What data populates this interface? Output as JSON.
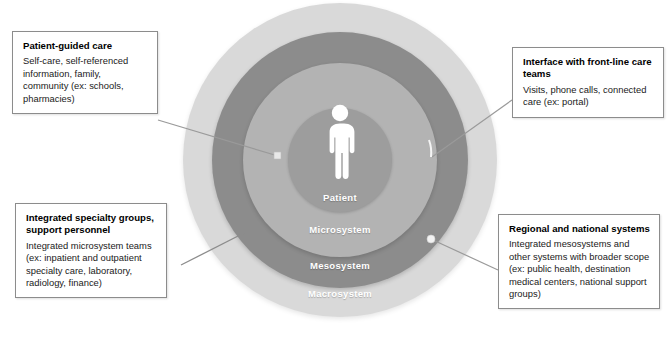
{
  "diagram": {
    "colors": {
      "macrosystem": "#d9d9d9",
      "mesosystem": "#8c8c8c",
      "microsystem": "#b3b3b3",
      "patient": "#9d9d9d",
      "box_border": "#8c8c8c",
      "connector": "#8c8c8c",
      "label_text": "#ffffff",
      "background": "#ffffff"
    },
    "rings": [
      {
        "id": "patient",
        "label": "Patient"
      },
      {
        "id": "microsystem",
        "label": "Microsystem"
      },
      {
        "id": "mesosystem",
        "label": "Mesosystem"
      },
      {
        "id": "macrosystem",
        "label": "Macrosystem"
      }
    ],
    "person_icon": "person-pictogram-icon",
    "callouts": [
      {
        "id": "patient-guided-care",
        "title": "Patient-guided care",
        "body": "Self-care, self-referenced information, family, community (ex: schools, pharmacies)",
        "connects_to": "patient"
      },
      {
        "id": "interface-front-line-care-teams",
        "title": "Interface with front-line care teams",
        "body": "Visits, phone calls, connected care (ex: portal)",
        "connects_to": "microsystem"
      },
      {
        "id": "integrated-specialty-groups",
        "title": "Integrated specialty groups, support personnel",
        "body": "Integrated microsystem teams (ex: inpatient and outpatient specialty care, laboratory, radiology, finance)",
        "connects_to": "mesosystem"
      },
      {
        "id": "regional-and-national-systems",
        "title": "Regional and national systems",
        "body": "Integrated mesosystems and other systems with broader scope (ex: public health, destination medical centers, national support groups)",
        "connects_to": "macrosystem"
      }
    ]
  }
}
